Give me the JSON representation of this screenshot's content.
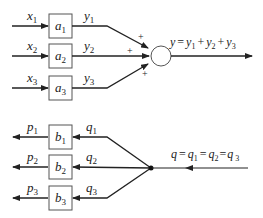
{
  "diagram": {
    "top": {
      "inputs": [
        {
          "var": "x",
          "sub": "1"
        },
        {
          "var": "x",
          "sub": "2"
        },
        {
          "var": "x",
          "sub": "3"
        }
      ],
      "blocks": [
        {
          "var": "a",
          "sub": "1"
        },
        {
          "var": "a",
          "sub": "2"
        },
        {
          "var": "a",
          "sub": "3"
        }
      ],
      "outputs": [
        {
          "var": "y",
          "sub": "1"
        },
        {
          "var": "y",
          "sub": "2"
        },
        {
          "var": "y",
          "sub": "3"
        }
      ],
      "signs": [
        "+",
        "+",
        "+"
      ],
      "equation": "y = y1 + y2 + y3",
      "eq_parts": {
        "y": "y",
        "eq": "=",
        "y1": "y",
        "s1": "1",
        "p1": "+",
        "y2": "y",
        "s2": "2",
        "p2": "+",
        "y3": "y",
        "s3": "3"
      }
    },
    "bottom": {
      "outputs": [
        {
          "var": "p",
          "sub": "1"
        },
        {
          "var": "p",
          "sub": "2"
        },
        {
          "var": "p",
          "sub": "3"
        }
      ],
      "blocks": [
        {
          "var": "b",
          "sub": "1"
        },
        {
          "var": "b",
          "sub": "2"
        },
        {
          "var": "b",
          "sub": "3"
        }
      ],
      "inputs": [
        {
          "var": "q",
          "sub": "1"
        },
        {
          "var": "q",
          "sub": "2"
        },
        {
          "var": "q",
          "sub": "3"
        }
      ],
      "equation": "q = q1 = q2 = q3",
      "eq_parts": {
        "q": "q",
        "e1": "=",
        "q1": "q",
        "s1": "1",
        "e2": "=",
        "q2": "q",
        "s2": "2",
        "e3": "=",
        "q3": "q",
        "s3": "3"
      }
    },
    "colors": {
      "line": "#2a2a2a",
      "box": "#555555"
    }
  }
}
